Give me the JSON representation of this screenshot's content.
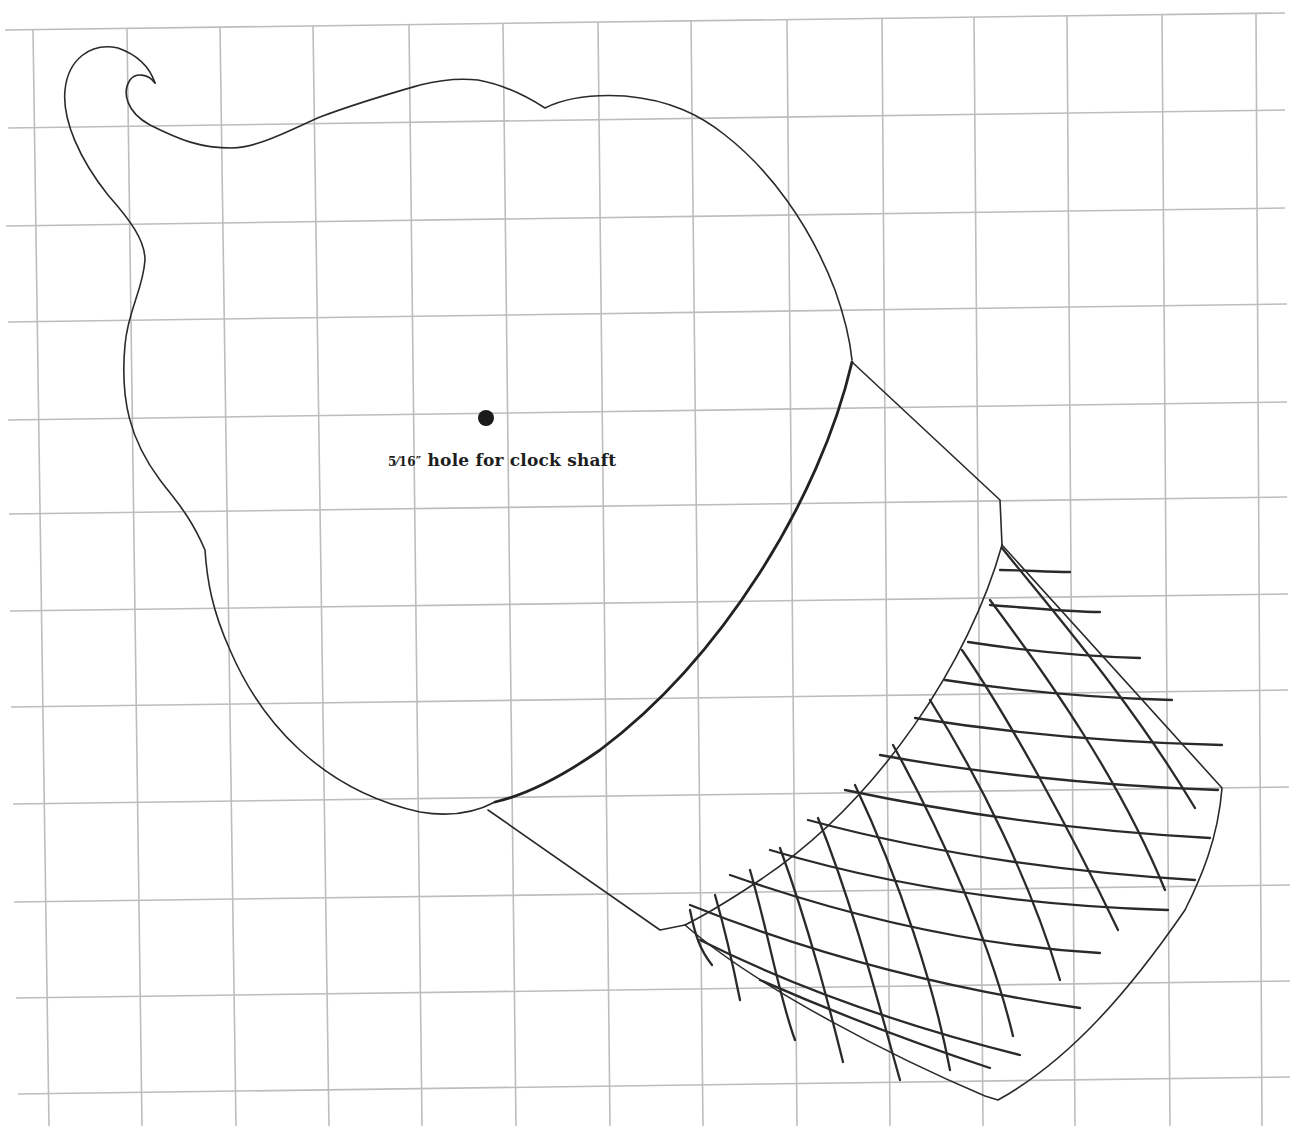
{
  "diagram": {
    "type": "pattern-template",
    "background_grid": {
      "color": "#bdbdbd",
      "columns": 14,
      "rows": 11
    },
    "parts": {
      "acorn_body": {
        "label": "acorn nut body",
        "stem": "curled stem at top-left"
      },
      "cap_band": {
        "label": "smooth cap rim band"
      },
      "cap_crosshatch": {
        "label": "crosshatched acorn cap"
      }
    },
    "hole_marker": {
      "fraction": "5⁄16″",
      "text": " hole for clock shaft",
      "color": "#1a1a1a"
    }
  }
}
